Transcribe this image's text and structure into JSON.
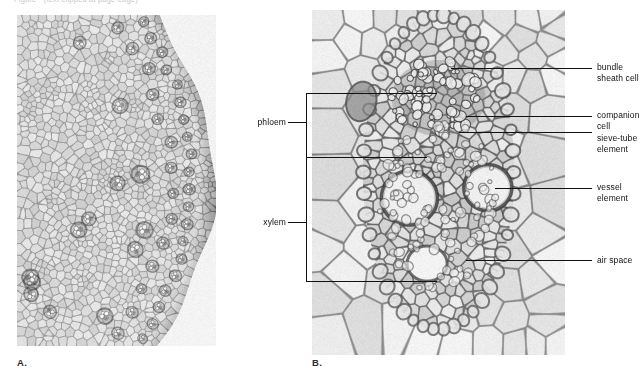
{
  "figure": {
    "clipped_header": "Figure   ·   (text clipped at page edge)",
    "panels": [
      {
        "id": "A",
        "caption": "A.",
        "subject": "stem cross-section, low magnification, showing scattered vascular bundles in ground tissue"
      },
      {
        "id": "B",
        "caption": "B.",
        "subject": "single vascular bundle, high magnification"
      }
    ]
  },
  "labels": {
    "bundle_sheath_cell": "bundle\nsheath cell",
    "companion_cell": "companion\ncell",
    "sieve_tube_element": "sieve-tube\nelement",
    "vessel_element": "vessel\nelement",
    "air_space": "air space",
    "phloem": "phloem",
    "xylem": "xylem"
  },
  "colors": {
    "ink": "#111111",
    "paper": "#ffffff",
    "tissue_light": "#efece6",
    "tissue_wall": "#8c877f",
    "tissue_dark": "#5d5953"
  }
}
